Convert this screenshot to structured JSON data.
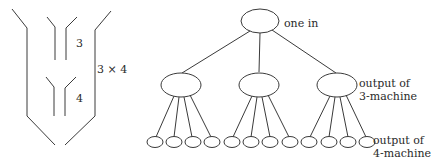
{
  "left_diagram": {
    "label_3": "3",
    "label_4": "4",
    "label_total": "3 × 4"
  },
  "tree": {
    "root_label": "one in",
    "level1_label_line1": "output of",
    "level1_label_line2": "3-machine",
    "level2_label_line1": "output of",
    "level2_label_line2": "4-machine",
    "branching": [
      3,
      4
    ],
    "total_leaves": 12
  }
}
